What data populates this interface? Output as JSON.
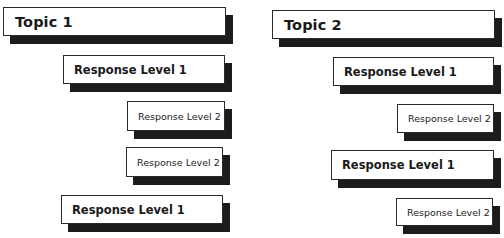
{
  "columns": [
    {
      "topic": "Topic 1",
      "items": [
        {
          "level": 1,
          "label": "Response Level 1"
        },
        {
          "level": 2,
          "label": "Response Level 2"
        },
        {
          "level": 2,
          "label": "Response Level 2"
        },
        {
          "level": 1,
          "label": "Response Level 1"
        }
      ]
    },
    {
      "topic": "Topic 2",
      "items": [
        {
          "level": 1,
          "label": "Response Level 1"
        },
        {
          "level": 2,
          "label": "Response Level 2"
        },
        {
          "level": 1,
          "label": "Response Level 1"
        },
        {
          "level": 2,
          "label": "Response Level 2"
        }
      ]
    }
  ],
  "colors": {
    "box_fill": "#ffffff",
    "box_border": "#2a2a2a",
    "shadow": "#1c1c1c",
    "text": "#1a1a1a"
  }
}
